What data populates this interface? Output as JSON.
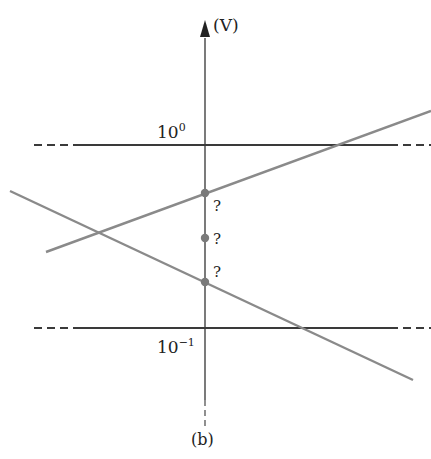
{
  "axis": {
    "unit_label": "(V)"
  },
  "levels": {
    "upper": {
      "base": "10",
      "exponent": "0"
    },
    "lower": {
      "base": "10",
      "exponent": "−1"
    }
  },
  "points": [
    {
      "label": "?"
    },
    {
      "label": "?"
    },
    {
      "label": "?"
    }
  ],
  "caption": "(b)",
  "colors": {
    "axis": "#333333",
    "level_line": "#3a3a3a",
    "sloped_line": "#8a8a8a",
    "point": "#7a7a7a"
  }
}
